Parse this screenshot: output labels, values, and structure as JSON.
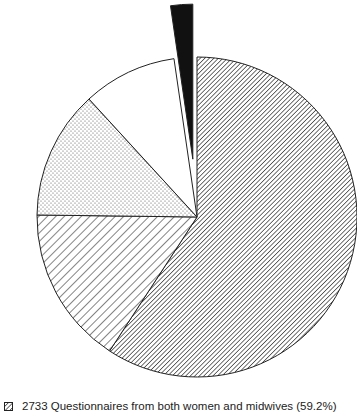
{
  "chart_data": {
    "type": "pie",
    "title": "",
    "slices": [
      {
        "label": "2733 Questionnaires from both women and midwives",
        "value": 59.2,
        "pattern": "dense-hatch",
        "label_visible": true
      },
      {
        "label": "",
        "value": 16.0,
        "pattern": "coarse-hatch",
        "label_visible": false,
        "value_estimated": true
      },
      {
        "label": "",
        "value": 13.0,
        "pattern": "dots",
        "label_visible": false,
        "value_estimated": true
      },
      {
        "label": "",
        "value": 9.5,
        "pattern": "white",
        "label_visible": false,
        "value_estimated": true
      },
      {
        "label": "",
        "value": 2.3,
        "pattern": "solid-black",
        "exploded": true,
        "label_visible": false,
        "value_estimated": true
      }
    ],
    "legend_position": "bottom"
  },
  "legend": {
    "items": [
      {
        "text": "2733 Questionnaires from both women and midwives (59.2%)"
      }
    ]
  }
}
